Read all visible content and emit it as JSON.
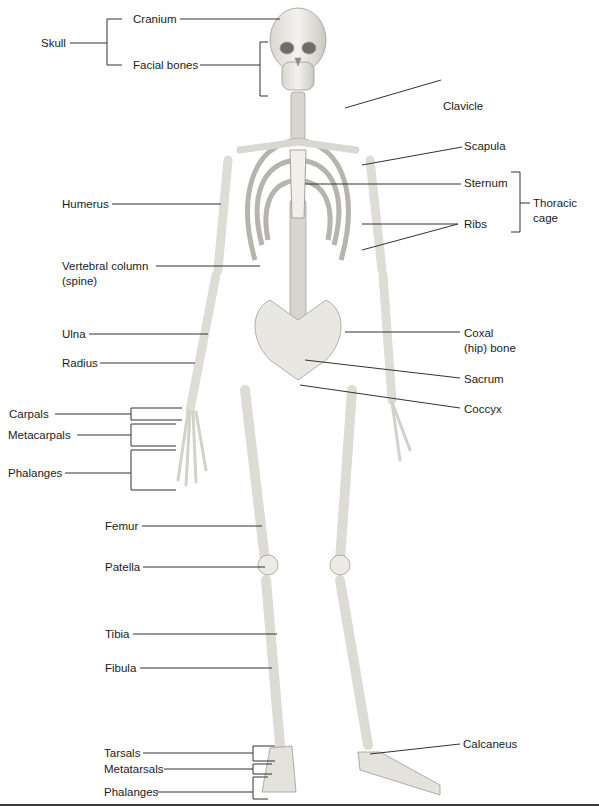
{
  "figure": {
    "labels_left": {
      "skull": "Skull",
      "cranium": "Cranium",
      "facial_bones": "Facial bones",
      "humerus": "Humerus",
      "vertebral_column": "Vertebral column",
      "vertebral_column_sub": "(spine)",
      "ulna": "Ulna",
      "radius": "Radius",
      "carpals": "Carpals",
      "metacarpals": "Metacarpals",
      "hand_phalanges": "Phalanges",
      "femur": "Femur",
      "patella": "Patella",
      "tibia": "Tibia",
      "fibula": "Fibula",
      "tarsals": "Tarsals",
      "metatarsals": "Metatarsals",
      "foot_phalanges": "Phalanges"
    },
    "labels_right": {
      "clavicle": "Clavicle",
      "scapula": "Scapula",
      "sternum": "Sternum",
      "ribs": "Ribs",
      "thoracic_cage": "Thoracic",
      "thoracic_cage_sub": "cage",
      "coxal": "Coxal",
      "coxal_sub": "(hip) bone",
      "sacrum": "Sacrum",
      "coccyx": "Coccyx",
      "calcaneus": "Calcaneus"
    },
    "colors": {
      "bone": "#ecebe6",
      "bone_shadow": "#b9b8b2",
      "leader_line": "#333333",
      "text": "#1b1b1b"
    }
  }
}
